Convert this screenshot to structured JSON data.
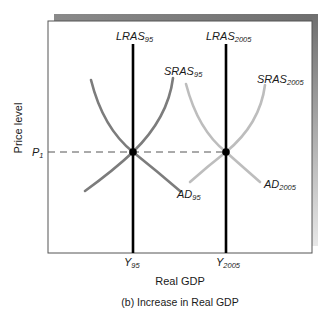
{
  "diagram": {
    "caption": "(b) Increase in Real GDP",
    "x_axis_label": "Real GDP",
    "y_axis_label": "Price level",
    "price_level": {
      "main": "P",
      "sub": "1"
    },
    "curves": {
      "lras_95": {
        "main": "LRAS",
        "sub": "95"
      },
      "lras_2005": {
        "main": "LRAS",
        "sub": "2005"
      },
      "sras_95": {
        "main": "SRAS",
        "sub": "95"
      },
      "sras_2005": {
        "main": "SRAS",
        "sub": "2005"
      },
      "ad_95": {
        "main": "AD",
        "sub": "95"
      },
      "ad_2005": {
        "main": "AD",
        "sub": "2005"
      }
    },
    "x_ticks": {
      "y_95": {
        "main": "Y",
        "sub": "95"
      },
      "y_2005": {
        "main": "Y",
        "sub": "2005"
      }
    },
    "colors": {
      "curves_95": "#7c7c7c",
      "curves_2005": "#bdbdbd",
      "lras": "#000000",
      "frame": "#555555",
      "shadow_dark": "#6e6e6e",
      "shadow_light": "#e6e6e6",
      "dashed": "#555555"
    }
  }
}
